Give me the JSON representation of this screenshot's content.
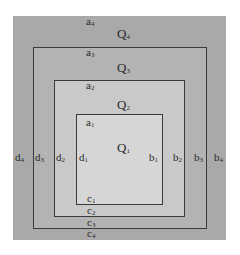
{
  "diagram": {
    "regions": [
      {
        "id": "Q4",
        "name": "Q",
        "sub": "4",
        "fill": "#a9a9a9"
      },
      {
        "id": "Q3",
        "name": "Q",
        "sub": "3",
        "fill": "#b3b3b3"
      },
      {
        "id": "Q2",
        "name": "Q",
        "sub": "2",
        "fill": "#c9c9c9"
      },
      {
        "id": "Q1",
        "name": "Q",
        "sub": "1",
        "fill": "#d6d6d6"
      }
    ],
    "labels": {
      "a4": {
        "t": "a",
        "s": "4"
      },
      "a3": {
        "t": "a",
        "s": "3"
      },
      "a2": {
        "t": "a",
        "s": "2"
      },
      "a1": {
        "t": "a",
        "s": "1"
      },
      "b1": {
        "t": "b",
        "s": "1"
      },
      "b2": {
        "t": "b",
        "s": "2"
      },
      "b3": {
        "t": "b",
        "s": "3"
      },
      "b4": {
        "t": "b",
        "s": "4"
      },
      "c1": {
        "t": "c",
        "s": "1"
      },
      "c2": {
        "t": "c",
        "s": "2"
      },
      "c3": {
        "t": "c",
        "s": "3"
      },
      "c4": {
        "t": "c",
        "s": "4"
      },
      "d1": {
        "t": "d",
        "s": "1"
      },
      "d2": {
        "t": "d",
        "s": "2"
      },
      "d3": {
        "t": "d",
        "s": "3"
      },
      "d4": {
        "t": "d",
        "s": "4"
      }
    },
    "q_labels": {
      "Q4": {
        "t": "Q",
        "s": "4"
      },
      "Q3": {
        "t": "Q",
        "s": "3"
      },
      "Q2": {
        "t": "Q",
        "s": "2"
      },
      "Q1": {
        "t": "Q",
        "s": "1"
      }
    },
    "border_color": "#3a3a3a"
  }
}
